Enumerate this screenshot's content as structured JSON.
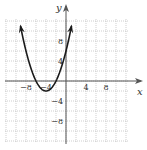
{
  "diagram": {
    "type": "coordinate-graph",
    "axes": {
      "x_label": "x",
      "y_label": "y",
      "x_ticks": [
        {
          "value": -8,
          "label": "−8"
        },
        {
          "value": -4,
          "label": "−4"
        },
        {
          "value": 4,
          "label": "4"
        },
        {
          "value": 8,
          "label": "8"
        }
      ],
      "y_ticks": [
        {
          "value": 8,
          "label": "8"
        },
        {
          "value": 4,
          "label": "4"
        },
        {
          "value": -4,
          "label": "−4"
        },
        {
          "value": -8,
          "label": "−8"
        }
      ],
      "grid_step": 2,
      "x_range": [
        -12,
        12
      ],
      "y_range": [
        -12,
        12
      ]
    },
    "curve": {
      "type": "parabola",
      "vertex": [
        -4,
        -2
      ],
      "x_intercepts": [
        -6,
        -2
      ],
      "y_intercept": 6,
      "opens": "up",
      "arrows": "both ends",
      "color": "#1a1a1a"
    },
    "colors": {
      "grid": "#b0b0b0",
      "axis": "#555555",
      "curve": "#1a1a1a"
    }
  }
}
